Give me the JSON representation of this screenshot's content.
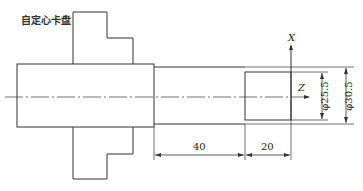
{
  "diagram": {
    "chuck_label": "自定心卡盘",
    "axis_x_label": "X",
    "axis_z_label": "Z",
    "dim_small_diameter": "φ25.5",
    "dim_large_diameter": "φ30.5",
    "dim_length_1": "40",
    "dim_length_2": "20",
    "line_color": "#333333"
  }
}
